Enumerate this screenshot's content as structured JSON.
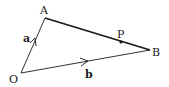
{
  "diagram": {
    "type": "vector-triangle",
    "points": {
      "O": {
        "label": "O",
        "x": 21,
        "y": 73
      },
      "A": {
        "label": "A",
        "x": 45,
        "y": 18
      },
      "B": {
        "label": "B",
        "x": 150,
        "y": 50
      },
      "P": {
        "label": "P",
        "x": 121,
        "y": 42
      }
    },
    "vectors": [
      {
        "name": "a",
        "label": "a",
        "from": "O",
        "to": "A"
      },
      {
        "name": "b",
        "label": "b",
        "from": "O",
        "to": "B"
      }
    ],
    "segments": [
      {
        "from": "A",
        "to": "B",
        "style": "thick"
      }
    ],
    "colors": {
      "stroke": "#1a1a1a",
      "background": "#ffffff"
    }
  }
}
